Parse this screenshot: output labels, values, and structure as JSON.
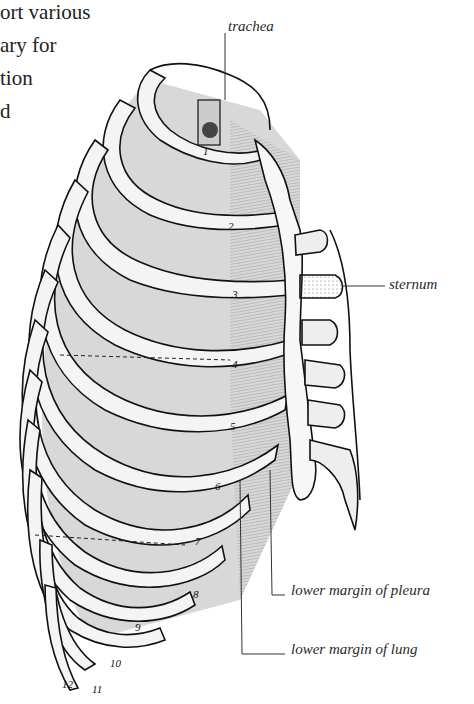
{
  "body_text": {
    "lines": [
      "ort various",
      "ary for",
      "tion",
      "d"
    ]
  },
  "diagram": {
    "labels": {
      "trachea": "trachea",
      "sternum": "sternum",
      "pleura": "lower margin of pleura",
      "lung": "lower margin of lung"
    },
    "rib_numbers": [
      "1",
      "2",
      "3",
      "4",
      "5",
      "6",
      "7",
      "8",
      "9",
      "10",
      "11",
      "12"
    ]
  }
}
